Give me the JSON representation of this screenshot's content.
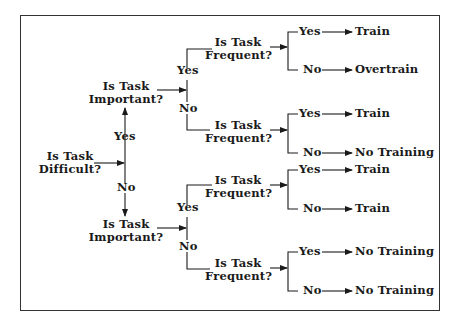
{
  "diagram": {
    "type": "decision-tree",
    "root": {
      "question": [
        "Is Task",
        "Difficult?"
      ],
      "yes_label": "Yes",
      "no_label": "No"
    },
    "important_top": {
      "question": [
        "Is Task",
        "Important?"
      ],
      "yes_label": "Yes",
      "no_label": "No"
    },
    "important_bottom": {
      "question": [
        "Is Task",
        "Important?"
      ],
      "yes_label": "Yes",
      "no_label": "No"
    },
    "frequent_nodes": [
      {
        "question": [
          "Is Task",
          "Frequent?"
        ],
        "yes_label": "Yes",
        "yes_outcome": "Train",
        "no_label": "No",
        "no_outcome": "Overtrain"
      },
      {
        "question": [
          "Is Task",
          "Frequent?"
        ],
        "yes_label": "Yes",
        "yes_outcome": "Train",
        "no_label": "No",
        "no_outcome": "No Training"
      },
      {
        "question": [
          "Is Task",
          "Frequent?"
        ],
        "yes_label": "Yes",
        "yes_outcome": "Train",
        "no_label": "No",
        "no_outcome": "Train"
      },
      {
        "question": [
          "Is Task",
          "Frequent?"
        ],
        "yes_label": "Yes",
        "yes_outcome": "No Training",
        "no_label": "No",
        "no_outcome": "No Training"
      }
    ],
    "colors": {
      "ink": "#1a1a1a",
      "background": "#ffffff"
    }
  }
}
